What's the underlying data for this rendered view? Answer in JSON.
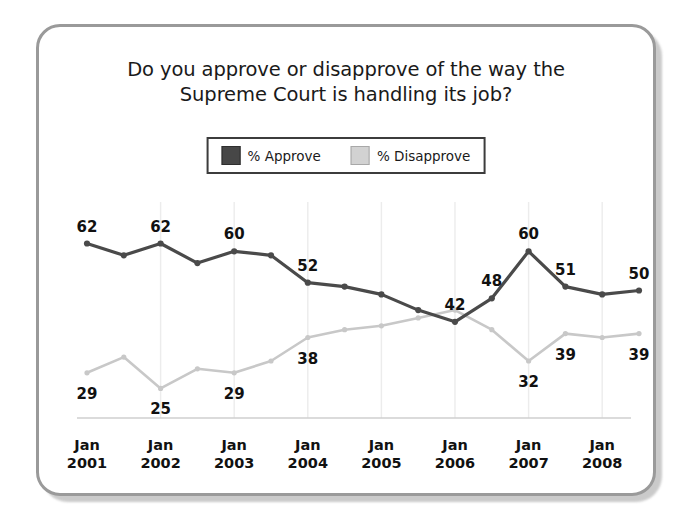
{
  "card": {
    "border_color": "#9a9a9a",
    "background": "#ffffff"
  },
  "title": {
    "line1": "Do you approve or disapprove of the way the",
    "line2": "Supreme Court is handling its job?"
  },
  "legend": {
    "items": [
      {
        "label": "% Approve",
        "color": "#474747",
        "name": "approve"
      },
      {
        "label": "% Disapprove",
        "color": "#d2d2d2",
        "name": "disapprove"
      }
    ]
  },
  "axis": {
    "ticks": [
      {
        "month": "Jan",
        "year": "2001"
      },
      {
        "month": "Jan",
        "year": "2002"
      },
      {
        "month": "Jan",
        "year": "2003"
      },
      {
        "month": "Jan",
        "year": "2004"
      },
      {
        "month": "Jan",
        "year": "2005"
      },
      {
        "month": "Jan",
        "year": "2006"
      },
      {
        "month": "Jan",
        "year": "2007"
      },
      {
        "month": "Jan",
        "year": "2008"
      }
    ]
  },
  "chart_data": {
    "type": "line",
    "title": "Do you approve or disapprove of the way the Supreme Court is handling its job?",
    "xlabel": "",
    "ylabel": "",
    "ylim": [
      20,
      68
    ],
    "grid": true,
    "legend_position": "top-center",
    "x": [
      "Jan 2001",
      "Jun 2001",
      "Jan 2002",
      "Jun 2002",
      "Jan 2003",
      "Jun 2003",
      "Jan 2004",
      "Jun 2004",
      "Jan 2005",
      "Jun 2005",
      "Sep 2005",
      "Jan 2006",
      "Jan 2007",
      "Jun 2007",
      "Jan 2008",
      "Jun 2008"
    ],
    "series": [
      {
        "name": "% Approve",
        "color": "#4a4a4a",
        "values": [
          62,
          59,
          62,
          57,
          60,
          59,
          52,
          51,
          49,
          45,
          42,
          48,
          60,
          51,
          49,
          50
        ]
      },
      {
        "name": "% Disapprove",
        "color": "#c8c8c8",
        "values": [
          29,
          33,
          25,
          30,
          29,
          32,
          38,
          40,
          41,
          43,
          45,
          40,
          32,
          39,
          38,
          39
        ]
      }
    ],
    "point_labels": [
      {
        "series": "% Approve",
        "index": 0,
        "text": "62"
      },
      {
        "series": "% Approve",
        "index": 2,
        "text": "62"
      },
      {
        "series": "% Approve",
        "index": 4,
        "text": "60"
      },
      {
        "series": "% Approve",
        "index": 6,
        "text": "52"
      },
      {
        "series": "% Approve",
        "index": 11,
        "text": "48"
      },
      {
        "series": "% Approve",
        "index": 10,
        "text": "42"
      },
      {
        "series": "% Approve",
        "index": 12,
        "text": "60"
      },
      {
        "series": "% Approve",
        "index": 13,
        "text": "51"
      },
      {
        "series": "% Approve",
        "index": 15,
        "text": "50"
      },
      {
        "series": "% Disapprove",
        "index": 0,
        "text": "29"
      },
      {
        "series": "% Disapprove",
        "index": 2,
        "text": "25"
      },
      {
        "series": "% Disapprove",
        "index": 4,
        "text": "29"
      },
      {
        "series": "% Disapprove",
        "index": 6,
        "text": "38"
      },
      {
        "series": "% Disapprove",
        "index": 12,
        "text": "32"
      },
      {
        "series": "% Disapprove",
        "index": 13,
        "text": "39"
      },
      {
        "series": "% Disapprove",
        "index": 15,
        "text": "39"
      }
    ]
  }
}
